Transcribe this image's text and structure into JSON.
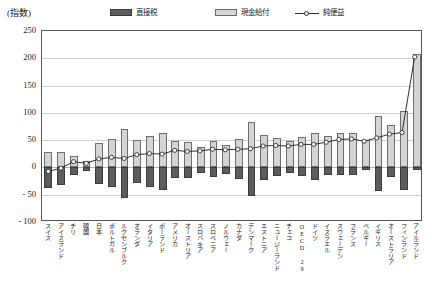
{
  "chart_data": {
    "type": "bar",
    "title": "",
    "subtitle": "",
    "unit_label": "(指数)",
    "xlabel": "",
    "ylabel": "",
    "ylim": [
      -100,
      250
    ],
    "yticks": [
      250,
      200,
      150,
      100,
      50,
      0,
      -50,
      -100
    ],
    "ytick_labels": [
      "250",
      "200",
      "150",
      "100",
      "50",
      "0",
      "- 50",
      "- 100"
    ],
    "grid": true,
    "legend_position": "top",
    "legend": [
      {
        "label": "直接税",
        "type": "bar",
        "color": "#5c5c5c"
      },
      {
        "label": "現金給付",
        "type": "bar",
        "color": "#d4d4d4"
      },
      {
        "label": "純便益",
        "type": "line",
        "color": "#2e2e2e",
        "marker": "open-circle"
      }
    ],
    "categories": [
      "スイス",
      "アイスランド",
      "チリ",
      "韓国",
      "日本",
      "ポルトガル",
      "ルクセンブルク",
      "オランダ",
      "イタリア",
      "ポーランド",
      "アメリカ",
      "オーストリア",
      "スロバキア",
      "スロベニア",
      "ノルウェー",
      "カナダ",
      "デンマーク",
      "エストニア",
      "ニュージーランド",
      "チェコ",
      "OECD 29",
      "ドイツ",
      "イスラエル",
      "スウェーデン",
      "フランス",
      "ベルギー",
      "イギリス",
      "オーストラリア",
      "フィンランド",
      "アイルランド"
    ],
    "series": [
      {
        "name": "現金給付",
        "kind": "bar-positive",
        "values": [
          28,
          29,
          21,
          12,
          44,
          52,
          70,
          50,
          58,
          64,
          49,
          46,
          38,
          48,
          42,
          53,
          84,
          60,
          54,
          48,
          55,
          63,
          58,
          63,
          63,
          50,
          95,
          77,
          104,
          207
        ]
      },
      {
        "name": "直接税",
        "kind": "bar-negative",
        "values": [
          -38,
          -33,
          -13,
          -7,
          -31,
          -36,
          -56,
          -29,
          -35,
          -42,
          -20,
          -19,
          -10,
          -17,
          -12,
          -22,
          -52,
          -23,
          -16,
          -11,
          -15,
          -23,
          -14,
          -14,
          -13,
          -4,
          -43,
          -18,
          -42,
          -5
        ]
      },
      {
        "name": "純便益",
        "kind": "line",
        "values": [
          -10,
          -4,
          8,
          5,
          13,
          16,
          14,
          21,
          23,
          22,
          29,
          27,
          28,
          31,
          30,
          31,
          32,
          37,
          38,
          37,
          40,
          40,
          44,
          49,
          50,
          46,
          52,
          59,
          62,
          202
        ]
      }
    ]
  }
}
